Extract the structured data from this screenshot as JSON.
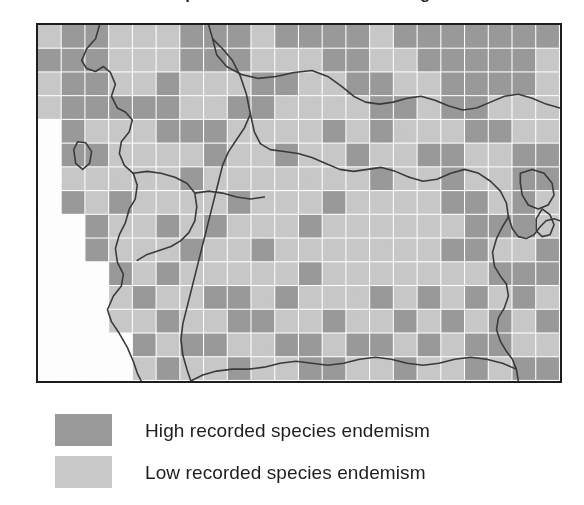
{
  "figure": {
    "title": "Recorded species endemism in the Congo Basin",
    "type": "choropleth-grid-map",
    "region": "Congo Basin, Central Africa"
  },
  "map": {
    "frame": {
      "x": 36,
      "y": 23,
      "width": 526,
      "height": 360,
      "border_color": "#1d1d1d"
    },
    "grid": {
      "columns": 22,
      "rows": 15,
      "cell_width": 23.9,
      "cell_height": 24.0,
      "gridline_color": "#ffffff"
    },
    "colors": {
      "high": "#9a9a9a",
      "low": "#c9c9c9",
      "nodata": "#ffffff",
      "border_line": "#3a3a3a",
      "frame": "#1d1d1d",
      "paper": "#ffffff"
    },
    "legend_value_map": {
      "0": "nodata",
      "1": "low",
      "2": "high"
    },
    "cells": [
      [
        1,
        2,
        2,
        1,
        1,
        1,
        2,
        2,
        2,
        1,
        2,
        2,
        2,
        2,
        1,
        2,
        2,
        2,
        2,
        2,
        2,
        2
      ],
      [
        2,
        2,
        2,
        1,
        1,
        1,
        2,
        2,
        2,
        1,
        1,
        1,
        2,
        2,
        1,
        1,
        2,
        2,
        2,
        2,
        2,
        1
      ],
      [
        1,
        2,
        2,
        1,
        1,
        2,
        1,
        1,
        1,
        2,
        2,
        1,
        1,
        2,
        2,
        1,
        1,
        2,
        2,
        2,
        2,
        1
      ],
      [
        1,
        2,
        2,
        2,
        2,
        2,
        1,
        1,
        2,
        2,
        1,
        1,
        1,
        1,
        2,
        2,
        1,
        2,
        2,
        1,
        1,
        1
      ],
      [
        0,
        2,
        1,
        1,
        1,
        2,
        2,
        2,
        1,
        1,
        1,
        1,
        2,
        1,
        2,
        1,
        1,
        1,
        2,
        2,
        1,
        1
      ],
      [
        0,
        2,
        2,
        1,
        1,
        1,
        1,
        2,
        1,
        1,
        2,
        1,
        1,
        2,
        1,
        1,
        2,
        2,
        1,
        1,
        2,
        2
      ],
      [
        0,
        1,
        1,
        1,
        1,
        1,
        2,
        1,
        1,
        1,
        1,
        1,
        1,
        1,
        2,
        1,
        1,
        2,
        1,
        1,
        2,
        2
      ],
      [
        0,
        2,
        1,
        2,
        1,
        1,
        1,
        1,
        2,
        1,
        1,
        1,
        2,
        1,
        1,
        1,
        1,
        2,
        2,
        1,
        2,
        1
      ],
      [
        0,
        0,
        2,
        1,
        1,
        2,
        1,
        2,
        1,
        1,
        1,
        2,
        1,
        1,
        1,
        1,
        1,
        1,
        2,
        2,
        2,
        1
      ],
      [
        0,
        0,
        2,
        1,
        1,
        1,
        2,
        1,
        1,
        2,
        1,
        1,
        1,
        1,
        1,
        1,
        1,
        2,
        2,
        1,
        1,
        2
      ],
      [
        0,
        0,
        0,
        2,
        1,
        2,
        1,
        1,
        1,
        1,
        1,
        2,
        1,
        1,
        1,
        1,
        1,
        1,
        1,
        2,
        2,
        2
      ],
      [
        0,
        0,
        0,
        1,
        2,
        1,
        1,
        2,
        2,
        1,
        2,
        1,
        1,
        1,
        2,
        1,
        2,
        1,
        2,
        1,
        2,
        1
      ],
      [
        0,
        0,
        0,
        1,
        1,
        2,
        1,
        1,
        2,
        2,
        1,
        1,
        2,
        1,
        1,
        2,
        1,
        2,
        1,
        2,
        1,
        2
      ],
      [
        0,
        0,
        0,
        0,
        2,
        1,
        2,
        2,
        1,
        1,
        2,
        2,
        1,
        2,
        2,
        1,
        2,
        1,
        2,
        2,
        1,
        1
      ],
      [
        0,
        0,
        0,
        0,
        1,
        2,
        1,
        1,
        2,
        1,
        1,
        2,
        2,
        1,
        1,
        2,
        1,
        1,
        2,
        1,
        2,
        2
      ]
    ]
  },
  "legend": {
    "items": [
      {
        "swatch": "high-swatch",
        "color": "#9a9a9a",
        "label": "High recorded species endemism"
      },
      {
        "swatch": "low-swatch",
        "color": "#c9c9c9",
        "label": "Low recorded species endemism"
      }
    ]
  }
}
